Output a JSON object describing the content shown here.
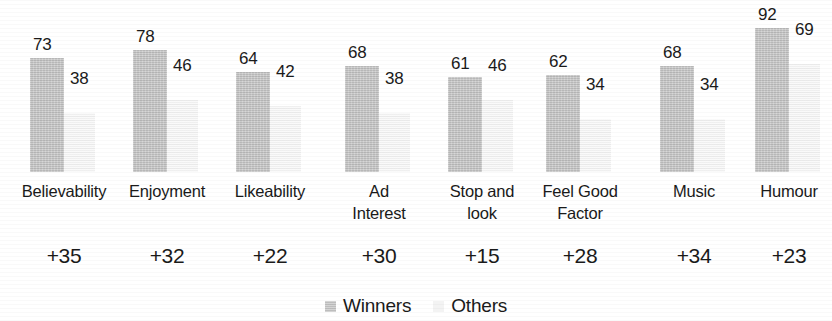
{
  "chart_data": {
    "type": "bar",
    "title": "",
    "subtitle": "",
    "xlabel": "",
    "ylabel": "",
    "ylim": [
      0,
      100
    ],
    "grid": false,
    "legend_position": "bottom-center",
    "categories": [
      "Believability",
      "Enjoyment",
      "Likeability",
      "Ad Interest",
      "Stop and look",
      "Feel Good Factor",
      "Music",
      "Humour"
    ],
    "category_lines": [
      [
        "Believability"
      ],
      [
        "Enjoyment"
      ],
      [
        "Likeability"
      ],
      [
        "Ad",
        "Interest"
      ],
      [
        "Stop and",
        "look"
      ],
      [
        "Feel Good",
        "Factor"
      ],
      [
        "Music"
      ],
      [
        "Humour"
      ]
    ],
    "series": [
      {
        "name": "Winners",
        "color": "#c9c9c9",
        "values": [
          73,
          78,
          64,
          68,
          61,
          62,
          68,
          92
        ]
      },
      {
        "name": "Others",
        "color": "#f4f4f4",
        "values": [
          38,
          46,
          42,
          38,
          46,
          34,
          34,
          69
        ]
      }
    ],
    "annotations": {
      "label": "difference",
      "values": [
        "+35",
        "+32",
        "+22",
        "+30",
        "+15",
        "+28",
        "+34",
        "+23"
      ]
    }
  },
  "legend": {
    "items": [
      {
        "label": "Winners",
        "swatch": "winners-swatch"
      },
      {
        "label": "Others",
        "swatch": "others-swatch"
      }
    ]
  }
}
